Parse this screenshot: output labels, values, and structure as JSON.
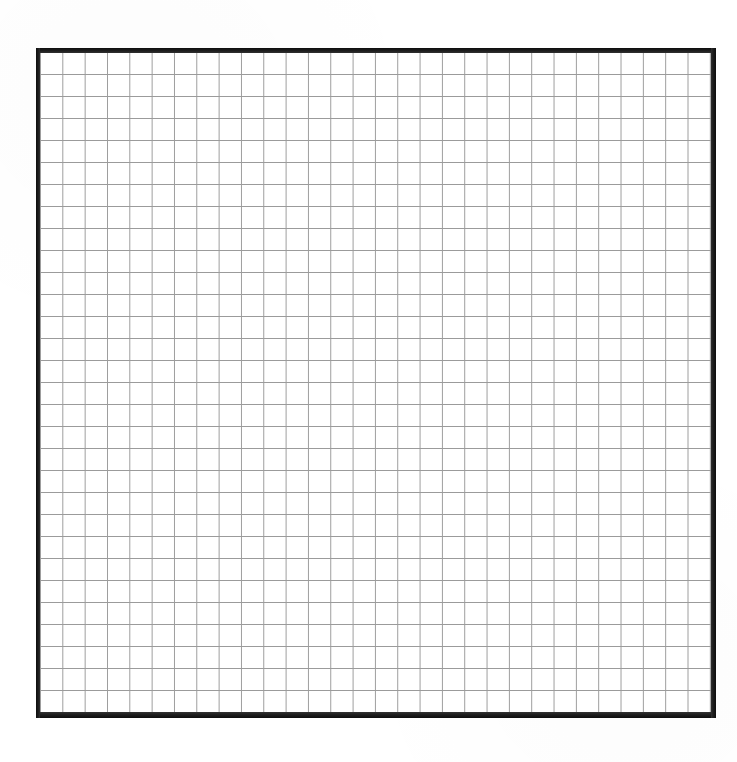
{
  "document": {
    "kind": "graph-paper-grid",
    "title": "Blank Graph Paper Grid",
    "description": "A scanned sheet of blank square graph paper consisting of a heavy black rectangular border enclosing a uniform square grid of thin grey rules. No text, labels, numbers or annotations appear anywhere on the sheet.",
    "page_width": 737,
    "page_height": 762,
    "page_background_color": "#ffffff"
  },
  "chart_data": {
    "type": "table",
    "title": "",
    "subtitle": "",
    "xlabel": "",
    "ylabel": "",
    "columns": 30,
    "rows": 30,
    "cell_size_px": 22.3,
    "grid": "on",
    "legend": "none",
    "annotations": [],
    "tick_labels_x": [],
    "tick_labels_y": [],
    "values": []
  },
  "grid": {
    "name": "graph-paper-grid",
    "columns": 30,
    "rows": 30,
    "cell_width_px": 22.33,
    "cell_height_px": 22.0,
    "line_color": "#9b9b9b",
    "line_width_px": 1,
    "fill_color": "#ffffff",
    "interior": {
      "left": 40,
      "top": 52,
      "width": 672,
      "height": 661
    }
  },
  "border": {
    "name": "grid-frame-border",
    "color": "#161616",
    "top": {
      "x": 36,
      "y": 48,
      "width": 680,
      "height": 5
    },
    "bottom": {
      "x": 36,
      "y": 712,
      "width": 680,
      "height": 6
    },
    "left": {
      "x": 36,
      "y": 48,
      "width": 4,
      "height": 670
    },
    "right": {
      "x": 711,
      "y": 48,
      "width": 5,
      "height": 670
    }
  },
  "margins": {
    "top_px": 48,
    "left_px": 36,
    "right_px": 21,
    "bottom_px": 44,
    "content": ""
  }
}
